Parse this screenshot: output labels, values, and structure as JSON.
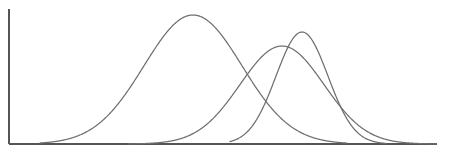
{
  "figure": {
    "width": 466,
    "height": 152,
    "background_color": "#ffffff",
    "title": "",
    "subtitle": ""
  },
  "axes": {
    "y_axis_label": "",
    "x_axis_label": "",
    "axis_color": "#555555",
    "origin_x": 9,
    "baseline_y": 144,
    "y_axis_top": 9,
    "x_axis_right": 437,
    "ticks_shown": false,
    "tick_labels": [],
    "gridlines": false
  },
  "chart_data": {
    "type": "line",
    "title": "",
    "xlabel": "",
    "ylabel": "",
    "xlim": [
      0,
      466
    ],
    "ylim": [
      0,
      135
    ],
    "grid": false,
    "legend": false,
    "legend_position": "none",
    "annotations": [],
    "series": [
      {
        "name": "curve-1",
        "label": "",
        "distribution": "normal",
        "mean_px": 193,
        "sigma_px": 49,
        "peak_height_px": 129,
        "peak_x_px": 193,
        "peak_y_px": 15,
        "left_tail_x_px": 40,
        "right_tail_x_px": 347,
        "color": "#6f6f6f",
        "stroke_width": 1.25
      },
      {
        "name": "curve-2",
        "label": "",
        "distribution": "normal",
        "mean_px": 282,
        "sigma_px": 42,
        "peak_height_px": 98,
        "peak_x_px": 282,
        "peak_y_px": 46,
        "left_tail_x_px": 129,
        "right_tail_x_px": 436,
        "color": "#6f6f6f",
        "stroke_width": 1.25
      },
      {
        "name": "curve-3",
        "label": "",
        "distribution": "normal",
        "mean_px": 302,
        "sigma_px": 26,
        "peak_height_px": 112,
        "peak_x_px": 302,
        "peak_y_px": 32,
        "left_tail_x_px": 230,
        "right_tail_x_px": 386,
        "color": "#6f6f6f",
        "stroke_width": 1.25
      }
    ]
  }
}
